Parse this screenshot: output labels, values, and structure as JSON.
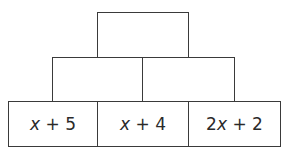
{
  "pyramid": {
    "rows": [
      {
        "level": "top",
        "bricks": [
          {
            "label": ""
          }
        ]
      },
      {
        "level": "middle",
        "bricks": [
          {
            "label": ""
          },
          {
            "label": ""
          }
        ]
      },
      {
        "level": "bottom",
        "bricks": [
          {
            "label": "x + 5",
            "coef": "",
            "var": "x",
            "rest": " + 5"
          },
          {
            "label": "x + 4",
            "coef": "",
            "var": "x",
            "rest": " + 4"
          },
          {
            "label": "2x + 2",
            "coef": "2",
            "var": "x",
            "rest": " + 2"
          }
        ]
      }
    ]
  }
}
